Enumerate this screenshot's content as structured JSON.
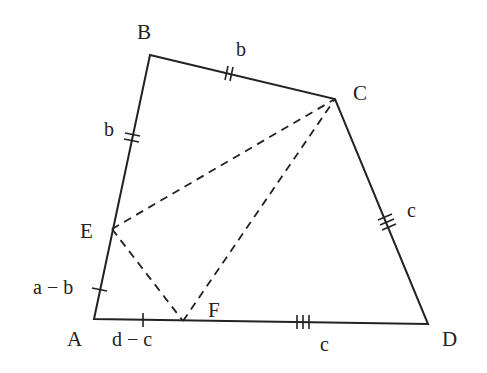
{
  "diagram": {
    "vertices": {
      "A": {
        "label": "A",
        "x": 94,
        "y": 319
      },
      "B": {
        "label": "B",
        "x": 150,
        "y": 55
      },
      "C": {
        "label": "C",
        "x": 335,
        "y": 99
      },
      "D": {
        "label": "D",
        "x": 428,
        "y": 324
      },
      "E": {
        "label": "E",
        "x": 112,
        "y": 229
      },
      "F": {
        "label": "F",
        "x": 183,
        "y": 321
      }
    },
    "side_labels": {
      "BE": "b",
      "BC": "b",
      "CD": "c",
      "FD": "c",
      "AE": "a − b",
      "AF": "d − c"
    },
    "tick_marks": {
      "AE": 1,
      "AF": 1,
      "BE": 2,
      "BC": 2,
      "CD": 3,
      "FD": 3
    },
    "solid_segments": [
      "AB",
      "BC",
      "CD",
      "DA"
    ],
    "dashed_segments": [
      "EC",
      "EF",
      "FC"
    ],
    "line_color": "#222222",
    "background": "#ffffff"
  }
}
